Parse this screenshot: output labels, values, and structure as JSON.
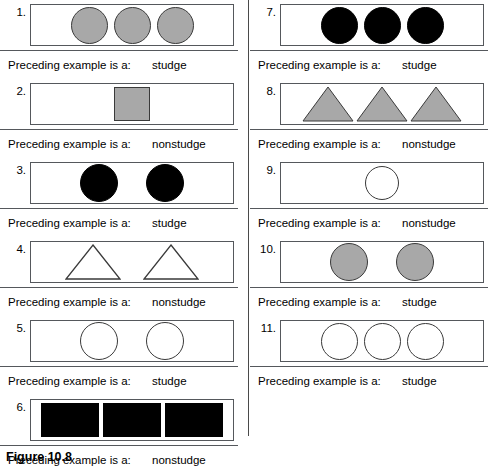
{
  "figure": {
    "caption": "Figure 10.8",
    "answer_prompt": "Preceding example is a:",
    "colors": {
      "gray_fill": "#a8a8a8",
      "black_fill": "#000000",
      "white_fill": "#ffffff",
      "outline": "#55585c",
      "shape_outline": "#3a3a3a"
    }
  },
  "columns": [
    {
      "name": "left-column",
      "examples": [
        {
          "number": "1.",
          "answer": "studge",
          "shape": "circle",
          "count": 3,
          "fill": "gray"
        },
        {
          "number": "2.",
          "answer": "nonstudge",
          "shape": "square",
          "count": 1,
          "fill": "gray"
        },
        {
          "number": "3.",
          "answer": "studge",
          "shape": "circle",
          "count": 2,
          "fill": "black"
        },
        {
          "number": "4.",
          "answer": "nonstudge",
          "shape": "triangle",
          "count": 2,
          "fill": "white"
        },
        {
          "number": "5.",
          "answer": "studge",
          "shape": "circle",
          "count": 2,
          "fill": "white"
        },
        {
          "number": "6.",
          "answer": "nonstudge",
          "shape": "square",
          "count": 3,
          "fill": "black"
        }
      ]
    },
    {
      "name": "right-column",
      "examples": [
        {
          "number": "7.",
          "answer": "studge",
          "shape": "circle",
          "count": 3,
          "fill": "black"
        },
        {
          "number": "8.",
          "answer": "nonstudge",
          "shape": "triangle",
          "count": 3,
          "fill": "gray"
        },
        {
          "number": "9.",
          "answer": "nonstudge",
          "shape": "circle",
          "count": 1,
          "fill": "white"
        },
        {
          "number": "10.",
          "answer": "studge",
          "shape": "circle",
          "count": 2,
          "fill": "gray"
        },
        {
          "number": "11.",
          "answer": "studge",
          "shape": "circle",
          "count": 3,
          "fill": "white"
        }
      ]
    }
  ]
}
